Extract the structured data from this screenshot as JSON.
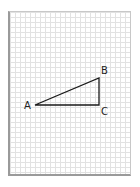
{
  "diagram": {
    "type": "right-triangle-on-graph-paper",
    "paper": {
      "grid_color": "#e2e2e2",
      "border_color": "#9a9a9a",
      "background": "#ffffff"
    },
    "triangle": {
      "stroke_color": "#1a1a1a",
      "vertices": {
        "A": {
          "x": 35,
          "y": 105
        },
        "B": {
          "x": 99,
          "y": 78
        },
        "C": {
          "x": 99,
          "y": 105
        }
      },
      "right_angle_at": "C"
    },
    "labels": {
      "a": "A",
      "b": "B",
      "c": "C"
    }
  }
}
